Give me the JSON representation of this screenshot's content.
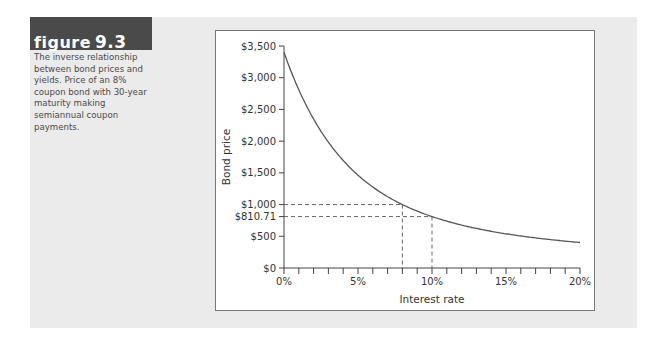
{
  "figure": {
    "label_word": "figure",
    "label_number": "9.3",
    "caption": "The inverse relationship between bond prices and yields. Price of an 8% coupon bond with 30-year maturity making semiannual coupon payments."
  },
  "colors": {
    "panel_bg": "#ebebeb",
    "header_bg": "#4a4a4a",
    "curve": "#555555"
  },
  "chart_data": {
    "type": "line",
    "title": "",
    "xlabel": "Interest rate",
    "ylabel": "Bond price",
    "xlim": [
      0,
      20
    ],
    "ylim": [
      0,
      3500
    ],
    "x_ticks": [
      "0%",
      "5%",
      "10%",
      "15%",
      "20%"
    ],
    "y_ticks": [
      "$0",
      "$500",
      "$1,000",
      "$1,500",
      "$2,000",
      "$2,500",
      "$3,000",
      "$3,500"
    ],
    "grid": false,
    "series": [
      {
        "name": "Bond price",
        "x": [
          0,
          1,
          2,
          3,
          4,
          5,
          6,
          7,
          8,
          9,
          10,
          11,
          12,
          13,
          14,
          15,
          16,
          17,
          18,
          19,
          20
        ],
        "values": [
          3400,
          2737,
          2245,
          1879,
          1605,
          1398,
          1241,
          1110,
          1000,
          900,
          810.71,
          738,
          676,
          622,
          575,
          535,
          500,
          470,
          445,
          422,
          402
        ]
      }
    ],
    "annotations": [
      {
        "label": "$1,000",
        "x": 8,
        "y": 1000,
        "style": "dashed-guides"
      },
      {
        "label": "$810.71",
        "x": 10,
        "y": 810.71,
        "style": "dashed-guides"
      }
    ]
  }
}
